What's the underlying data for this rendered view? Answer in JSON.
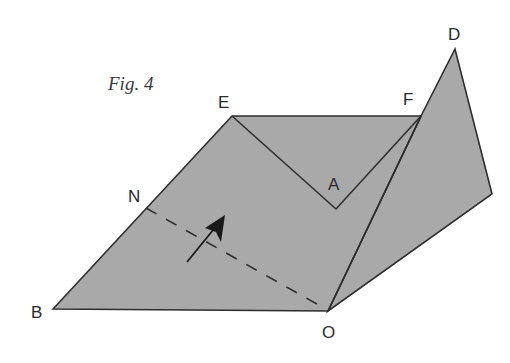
{
  "figure": {
    "caption": "Fig. 4",
    "fill_color": "#a9a9a9",
    "stroke_color": "#2e2e2e"
  },
  "points": {
    "E": {
      "label": "E",
      "x": 232,
      "y": 116
    },
    "F": {
      "label": "F",
      "x": 421,
      "y": 116
    },
    "D": {
      "label": "D",
      "x": 455,
      "y": 49
    },
    "A": {
      "label": "A",
      "x": 336,
      "y": 209
    },
    "N": {
      "label": "N",
      "x": 146,
      "y": 208
    },
    "B": {
      "label": "B",
      "x": 53,
      "y": 309
    },
    "O": {
      "label": "O",
      "x": 328,
      "y": 311
    }
  }
}
